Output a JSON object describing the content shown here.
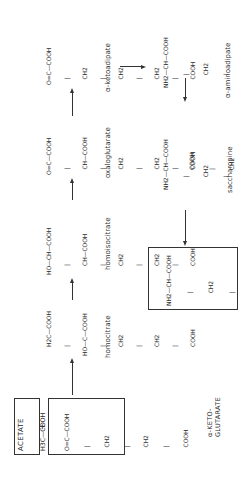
{
  "diagram": {
    "orientation": "rotated -90deg",
    "substrates": {
      "acetate": {
        "title": "ACETATE",
        "formula": [
          "H3C—COOH"
        ]
      },
      "plus": "+",
      "alpha_ketoglutarate": {
        "title_line1": "α-KETO-",
        "title_line2": "GLUTARATE",
        "formula": [
          "O=C—COOH",
          "  |",
          "  CH2",
          "  |",
          "  CH2",
          "  |",
          "  COOH"
        ]
      }
    },
    "compounds": [
      {
        "id": "homocitrate",
        "label": "homocitrate",
        "formula": [
          "     H2C—COOH",
          "     |",
          "HO—C—COOH",
          "     |",
          "     CH2",
          "     |",
          "     CH2",
          "     |",
          "     COOH"
        ]
      },
      {
        "id": "homoisocitrate",
        "label": "homoisocitrate",
        "formula": [
          "HO—CH—COOH",
          "     |",
          "     CH—COOH",
          "     |",
          "     CH2",
          "     |",
          "     CH2",
          "     |",
          "     COOH"
        ]
      },
      {
        "id": "oxaloglutarate",
        "label": "oxaloglutarate",
        "formula": [
          "O=C—COOH",
          "   |",
          "   CH—COOH",
          "   |",
          "   CH2",
          "   |",
          "   CH2",
          "   |",
          "   COOH"
        ]
      },
      {
        "id": "alpha_ketoadipate",
        "label": "α-ketoadipate",
        "formula": [
          "O=C—COOH",
          "   |",
          "   CH2",
          "   |",
          "   CH2",
          "   |",
          "   CH2",
          "   |",
          "   COOH"
        ]
      },
      {
        "id": "alpha_aminoadipate",
        "label": "α-aminoadipate",
        "formula": [
          "NH2—CH—COOH",
          "       |",
          "       CH2",
          "       |",
          "       CH2",
          "       |",
          "       CH2",
          "       |",
          "       COOH"
        ]
      },
      {
        "id": "saccharopine",
        "label": "saccharopine",
        "formula": [
          "           COOH",
          "           |",
          "           CH2",
          "           |",
          "           CH2",
          "           |",
          "CH2—NH—CH—COOH"
        ],
        "formula_left": [
          "NH2—CH—COOH",
          "       |",
          "       CH2",
          "       |",
          "       CH2",
          "       |",
          "       CH2",
          "       |"
        ]
      }
    ],
    "product": {
      "title": "LYSINE",
      "formula": [
        "NH2—CH—COOH",
        "       |",
        "       CH2",
        "       |",
        "       CH2",
        "       |",
        "       CH2",
        "       |",
        "       CH2—NH2"
      ]
    },
    "arrows": [
      {
        "from": "substrates",
        "to": "homocitrate"
      },
      {
        "from": "homocitrate",
        "to": "homoisocitrate"
      },
      {
        "from": "homoisocitrate",
        "to": "oxaloglutarate"
      },
      {
        "from": "oxaloglutarate",
        "to": "alpha_ketoadipate"
      },
      {
        "from": "alpha_ketoadipate",
        "to": "alpha_aminoadipate"
      },
      {
        "from": "alpha_aminoadipate",
        "to": "saccharopine"
      },
      {
        "from": "saccharopine",
        "to": "lysine"
      }
    ]
  }
}
